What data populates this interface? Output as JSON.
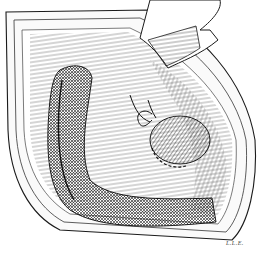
{
  "illustration": {
    "subject": "surgical-field-illustration",
    "style": "black-and-white pen-and-ink line drawing",
    "elements": [
      "incision-wound-edges",
      "retractor",
      "muscle-fibers",
      "curved-bowel-segment",
      "rounded-organ-with-sutured-base",
      "suture-threads"
    ],
    "signature": "L.L.E."
  },
  "colors": {
    "ink": "#1a1a1a",
    "background": "#ffffff",
    "shade": "#6b6b6b"
  }
}
